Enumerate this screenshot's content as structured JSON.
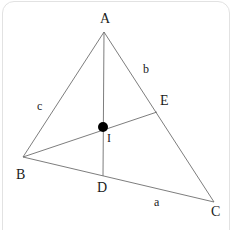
{
  "figure": {
    "canvas": {
      "width": 238,
      "height": 230
    },
    "stroke_color": "#6e6e6e",
    "point_color": "#000000",
    "label_color": "#1b1b1b",
    "border_color": "#e2e2e2",
    "background_color": "#ffffff",
    "vertices": [
      {
        "name": "A",
        "label": "A",
        "x": 104,
        "y": 32,
        "label_x": 100,
        "label_y": 12
      },
      {
        "name": "B",
        "label": "B",
        "x": 23,
        "y": 157,
        "label_x": 16,
        "label_y": 168
      },
      {
        "name": "C",
        "label": "C",
        "x": 214,
        "y": 202,
        "label_x": 211,
        "label_y": 205
      }
    ],
    "points": [
      {
        "name": "D",
        "label": "D",
        "x": 103,
        "y": 176,
        "label_x": 97,
        "label_y": 181,
        "marked": false
      },
      {
        "name": "E",
        "label": "E",
        "x": 157,
        "y": 112,
        "label_x": 160,
        "label_y": 94,
        "marked": false
      },
      {
        "name": "I",
        "label": "I",
        "x": 103,
        "y": 127,
        "label_x": 107,
        "label_y": 132,
        "marked": true,
        "radius": 5
      }
    ],
    "sides": [
      {
        "name": "side-a",
        "label": "a",
        "between": "B-C",
        "label_x": 154,
        "label_y": 196
      },
      {
        "name": "side-b",
        "label": "b",
        "between": "A-C",
        "label_x": 143,
        "label_y": 63
      },
      {
        "name": "side-c",
        "label": "c",
        "between": "A-B",
        "label_x": 37,
        "label_y": 100
      }
    ],
    "segments": [
      {
        "name": "segment-AB",
        "from": "A",
        "to": "B"
      },
      {
        "name": "segment-AC",
        "from": "A",
        "to": "C"
      },
      {
        "name": "segment-BC",
        "from": "B",
        "to": "C"
      },
      {
        "name": "cevian-AD",
        "from": "A",
        "to": "D"
      },
      {
        "name": "cevian-BE",
        "from": "B",
        "to": "E"
      }
    ]
  }
}
